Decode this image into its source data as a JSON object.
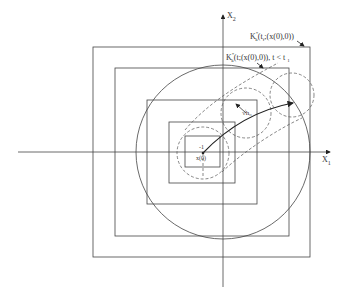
{
  "diagram": {
    "axes": {
      "x_label": "X",
      "x_sub": "1",
      "y_label": "X",
      "y_sub": "2"
    },
    "labels": {
      "outer_set": "K",
      "outer_set_sup": "*",
      "outer_set_sub": "k",
      "outer_set_args": "(t",
      "outer_set_args_sub": "f",
      "outer_set_args_rest": ";(x(0),0))",
      "inner_set": "K",
      "inner_set_sup": "*",
      "inner_set_sub": "k",
      "inner_set_args": "(t;(x(0),0)), t < t",
      "inner_set_args_sub": "1",
      "radius": "√h₀",
      "origin_top": "-1",
      "origin_bottom": "x(0)"
    },
    "colors": {
      "stroke": "#333333",
      "background": "#ffffff"
    }
  }
}
